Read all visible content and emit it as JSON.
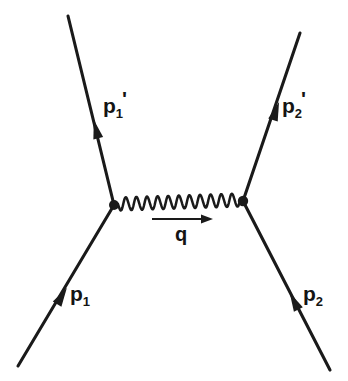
{
  "diagram": {
    "type": "feynman-diagram",
    "background_color": "#ffffff",
    "line_color": "#1a1a1a",
    "canvas": {
      "width": 348,
      "height": 381
    },
    "vertices": [
      {
        "id": "left-vertex",
        "x": 114,
        "y": 205,
        "radius": 5.0
      },
      {
        "id": "right-vertex",
        "x": 243,
        "y": 201,
        "radius": 5.2
      }
    ],
    "legs": [
      {
        "id": "p1-in",
        "label_base": "p",
        "label_sub": "1",
        "label_prime": "",
        "direction": "incoming",
        "from": {
          "x": 18,
          "y": 366
        },
        "to": {
          "x": 114,
          "y": 205
        },
        "arrow_at": {
          "x": 62,
          "y": 296
        },
        "arrow_angle_deg": -59
      },
      {
        "id": "p1-out",
        "label_base": "p",
        "label_sub": "1",
        "label_prime": "'",
        "direction": "outgoing",
        "from": {
          "x": 114,
          "y": 205
        },
        "to": {
          "x": 68,
          "y": 16
        },
        "arrow_at": {
          "x": 96,
          "y": 129
        },
        "arrow_angle_deg": -103.7
      },
      {
        "id": "p2-in",
        "label_base": "p",
        "label_sub": "2",
        "label_prime": "",
        "direction": "incoming",
        "from": {
          "x": 330,
          "y": 370
        },
        "to": {
          "x": 243,
          "y": 201
        },
        "arrow_at": {
          "x": 294,
          "y": 301
        },
        "arrow_angle_deg": -117.3
      },
      {
        "id": "p2-out",
        "label_base": "p",
        "label_sub": "2",
        "label_prime": "'",
        "direction": "outgoing",
        "from": {
          "x": 243,
          "y": 201
        },
        "to": {
          "x": 300,
          "y": 33
        },
        "arrow_at": {
          "x": 276,
          "y": 111
        },
        "arrow_angle_deg": -71.3
      }
    ],
    "propagator": {
      "id": "photon-propagator",
      "style": "wavy",
      "from": {
        "x": 118,
        "y": 204
      },
      "to": {
        "x": 240,
        "y": 200
      },
      "cycles": 11.5,
      "amplitude": 6.5
    },
    "momentum_transfer": {
      "id": "q-arrow",
      "label": "q",
      "shaft_from": {
        "x": 152,
        "y": 219
      },
      "shaft_to": {
        "x": 206,
        "y": 219
      },
      "head_tip": {
        "x": 213,
        "y": 219
      },
      "head_length": 12,
      "head_halfwidth": 4.5,
      "direction": "right"
    },
    "labels": {
      "p1_prime": {
        "base": "p",
        "sub": "1",
        "prime": "'"
      },
      "p2_prime": {
        "base": "p",
        "sub": "2",
        "prime": "'"
      },
      "p1": {
        "base": "p",
        "sub": "1",
        "prime": ""
      },
      "p2": {
        "base": "p",
        "sub": "2",
        "prime": ""
      },
      "q": "q"
    }
  }
}
